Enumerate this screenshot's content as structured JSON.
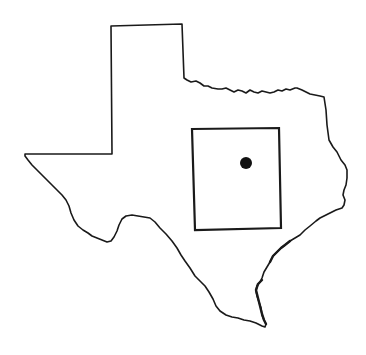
{
  "map": {
    "title": "",
    "region": "Texas",
    "features": [
      {
        "type": "state-outline",
        "name": "Texas"
      },
      {
        "type": "study-area-box",
        "name": "Study area"
      },
      {
        "type": "location-marker",
        "name": "Site location"
      }
    ],
    "colors": {
      "background": "#ffffff",
      "outline": "#1a1a1a",
      "marker": "#111111"
    }
  }
}
